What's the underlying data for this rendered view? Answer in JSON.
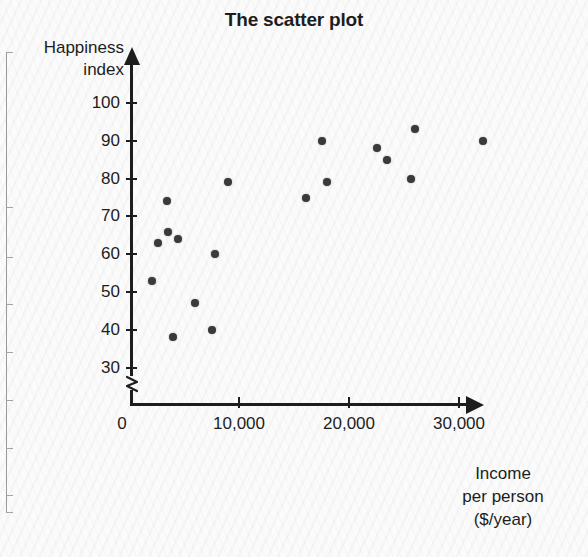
{
  "chart_data": {
    "type": "scatter",
    "title": "The scatter plot",
    "xlabel": "Income per person ($/year)",
    "xlabel_lines": [
      "Income",
      "per person",
      "($/year)"
    ],
    "ylabel": "Happiness index",
    "ylabel_lines": [
      "Happiness",
      "index"
    ],
    "xlim": [
      0,
      33500
    ],
    "ylim": [
      25,
      103
    ],
    "y_axis_broken": true,
    "grid": false,
    "legend": null,
    "xticks": [
      0,
      10000,
      20000,
      30000
    ],
    "xtick_labels": [
      "0",
      "10,000",
      "20,000",
      "30,000"
    ],
    "yticks": [
      30,
      40,
      50,
      60,
      70,
      80,
      90,
      100
    ],
    "ytick_labels": [
      "30",
      "40",
      "50",
      "60",
      "70",
      "80",
      "90",
      "100"
    ],
    "point_color": "#3a3a3a",
    "axis_color": "#1d1d1d",
    "points": [
      {
        "x": 2100,
        "y": 53
      },
      {
        "x": 2650,
        "y": 63
      },
      {
        "x": 3450,
        "y": 74
      },
      {
        "x": 3550,
        "y": 66
      },
      {
        "x": 4000,
        "y": 38
      },
      {
        "x": 4450,
        "y": 64
      },
      {
        "x": 6000,
        "y": 47
      },
      {
        "x": 7550,
        "y": 40
      },
      {
        "x": 7800,
        "y": 60
      },
      {
        "x": 9000,
        "y": 79
      },
      {
        "x": 16100,
        "y": 75
      },
      {
        "x": 17550,
        "y": 90
      },
      {
        "x": 18000,
        "y": 79
      },
      {
        "x": 22550,
        "y": 88
      },
      {
        "x": 23450,
        "y": 85
      },
      {
        "x": 25650,
        "y": 80
      },
      {
        "x": 26000,
        "y": 93
      },
      {
        "x": 32200,
        "y": 90
      }
    ]
  },
  "artifact": {
    "description": "partial-adjacent-figure-edge"
  }
}
